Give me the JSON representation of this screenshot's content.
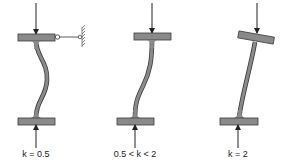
{
  "diagram": {
    "colors": {
      "member_fill": "#8a8a8a",
      "member_stroke": "#3a3a3a",
      "arrow": "#222222",
      "background": "#ffffff"
    },
    "panels": [
      {
        "id": "fixed-fixed",
        "label": "k = 0.5",
        "support": "top end fixed with lateral hinge restraint to wall"
      },
      {
        "id": "sway",
        "label": "0.5 < k < 2",
        "support": "top end restrained from rotation, free to sway"
      },
      {
        "id": "cantilever",
        "label": "k = 2",
        "support": "top end free to rotate and translate"
      }
    ]
  }
}
